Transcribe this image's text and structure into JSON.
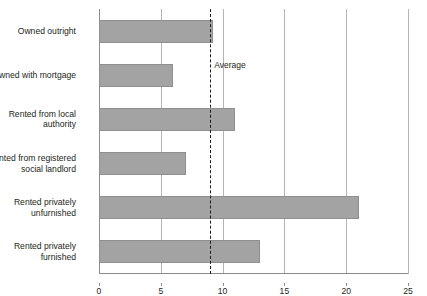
{
  "title_remnant": "",
  "chart_data": {
    "type": "bar",
    "orientation": "horizontal",
    "title": "",
    "xlabel": "",
    "ylabel": "",
    "xlim": [
      0,
      25
    ],
    "xticks": [
      0,
      5,
      10,
      15,
      20,
      25
    ],
    "xtick_labels": [
      "0",
      "5",
      "10",
      "15",
      "20",
      "25"
    ],
    "grid": true,
    "grid_axis": "x",
    "legend": null,
    "categories": [
      "Owned outright",
      "Owned with mortgage",
      "Rented from local\nauthority",
      "Rented from registered\nsocial landlord",
      "Rented privately\nunfurnished",
      "Rented privately\nfurnished"
    ],
    "values": [
      9.2,
      6.0,
      11.0,
      7.0,
      21.0,
      13.0
    ],
    "bar_color": "#a3a3a3",
    "bar_edge_color": "#8f8f8f",
    "annotations": [
      {
        "name": "average-line",
        "label": "Average",
        "value": 9.0,
        "style": "dashed",
        "color": "#1b1b1b"
      }
    ]
  }
}
